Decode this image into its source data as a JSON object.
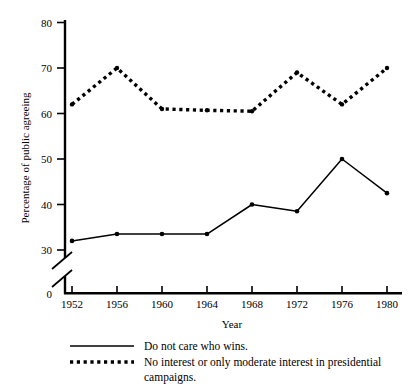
{
  "chart_data": {
    "type": "line",
    "title": "",
    "xlabel": "Year",
    "ylabel": "Percentage of public agreeing",
    "categories": [
      "1952",
      "1956",
      "1960",
      "1964",
      "1968",
      "1972",
      "1976",
      "1980"
    ],
    "x": [
      1952,
      1956,
      1960,
      1964,
      1968,
      1972,
      1976,
      1980
    ],
    "xlim": [
      1950,
      1982
    ],
    "ylim": [
      0,
      82
    ],
    "y_ticks": [
      "0",
      "30",
      "40",
      "50",
      "60",
      "70",
      "80"
    ],
    "y_tick_values": [
      0,
      30,
      40,
      50,
      60,
      70,
      80
    ],
    "y_axis_break": true,
    "y_axis_break_between": [
      0,
      30
    ],
    "grid": false,
    "legend_position": "below-plot",
    "series": [
      {
        "name": "Do not care who wins.",
        "style": "solid",
        "marker": "filled-circle",
        "color": "#000000",
        "values": [
          32,
          33.5,
          33.5,
          33.5,
          40,
          38.5,
          50,
          42.5
        ]
      },
      {
        "name": "No interest or only moderate interest in presidential campaigns.",
        "style": "dotted",
        "marker": "filled-circle",
        "color": "#000000",
        "values": [
          62,
          70,
          61,
          60.7,
          60.5,
          69,
          62,
          70
        ]
      }
    ]
  },
  "legend": {
    "entries": [
      {
        "label": "Do not care who wins.",
        "swatch": "solid-line-swatch"
      },
      {
        "label": "No interest or only moderate interest in presidential",
        "label2": "campaigns.",
        "swatch": "dotted-line-swatch"
      }
    ]
  },
  "axis": {
    "y_title": "Percentage of public agreeing",
    "x_title": "Year",
    "y_tick_0": "0",
    "y_tick_30": "30",
    "y_tick_40": "40",
    "y_tick_50": "50",
    "y_tick_60": "60",
    "y_tick_70": "70",
    "y_tick_80": "80",
    "x_tick_1": "1952",
    "x_tick_2": "1956",
    "x_tick_3": "1960",
    "x_tick_4": "1964",
    "x_tick_5": "1968",
    "x_tick_6": "1972",
    "x_tick_7": "1976",
    "x_tick_8": "1980"
  }
}
